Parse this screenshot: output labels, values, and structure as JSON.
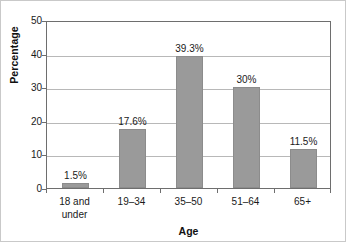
{
  "chart_data": {
    "type": "bar",
    "title": "",
    "subtitle": "",
    "xlabel": "Age",
    "ylabel": "Percentage",
    "categories": [
      "18 and\nunder",
      "19–34",
      "35–50",
      "51–64",
      "65+"
    ],
    "values": [
      1.5,
      17.6,
      39.3,
      30,
      11.5
    ],
    "data_labels": [
      "1.5%",
      "17.6%",
      "39.3%",
      "30%",
      "11.5%"
    ],
    "ylim": [
      0,
      50
    ],
    "ytick_values": [
      0,
      10,
      20,
      30,
      40,
      50
    ],
    "ytick_labels": [
      "0",
      "10",
      "20",
      "30",
      "40",
      "50"
    ],
    "grid": "horizontal",
    "legend": "none",
    "bar_color": "#9a9a9a",
    "bar_edge_color": "#8c8c8c",
    "gridline_color": "#b8b8b8",
    "axis_color": "#6e6e6e",
    "background_color": "#ffffff"
  }
}
